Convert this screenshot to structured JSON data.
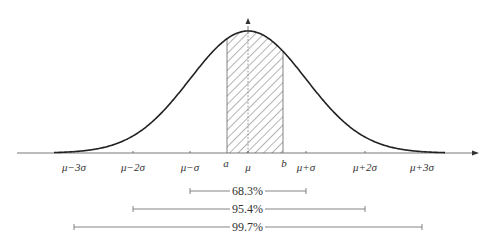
{
  "diagram": {
    "axis": {
      "ticks": [
        {
          "label": "μ−3σ",
          "x": 74
        },
        {
          "label": "μ−2σ",
          "x": 133
        },
        {
          "label": "μ−σ",
          "x": 190
        },
        {
          "label": "μ",
          "x": 248
        },
        {
          "label": "μ+σ",
          "x": 306
        },
        {
          "label": "μ+2σ",
          "x": 365
        },
        {
          "label": "μ+3σ",
          "x": 422
        }
      ],
      "markers": [
        {
          "label": "a",
          "x": 227
        },
        {
          "label": "b",
          "x": 283
        }
      ]
    },
    "shaded_region": {
      "from": "a",
      "to": "b",
      "pattern": "diagonal-hatch"
    },
    "intervals": [
      {
        "label": "68.3%",
        "from": "μ−σ",
        "to": "μ+σ"
      },
      {
        "label": "95.4%",
        "from": "μ−2σ",
        "to": "μ+2σ"
      },
      {
        "label": "99.7%",
        "from": "μ−3σ",
        "to": "μ+3σ"
      }
    ],
    "colors": {
      "stroke": "#222222",
      "axis": "#555555",
      "text": "#333333"
    }
  }
}
